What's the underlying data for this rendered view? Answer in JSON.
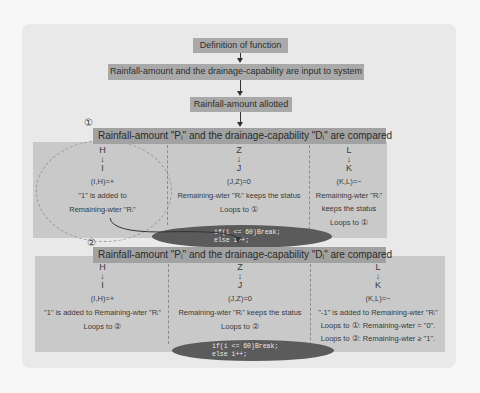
{
  "flow": {
    "step1": "Definition of function",
    "step2": "Rainfall-amount and the drainage-capability are input to system",
    "step3": "Rainfall-amount allotted"
  },
  "section1": {
    "number": "①",
    "header": "Rainfall-amount \"Pᵢ\" and the drainage-capability \"Dᵢ\" are compared",
    "columns": [
      {
        "top": "H",
        "arrow": "↓",
        "mid": "I",
        "pair": "(I,H)=+",
        "lines": [
          "\"1\" is added to",
          "Remaining-wter \"Rᵢ\""
        ]
      },
      {
        "top": "Z",
        "arrow": "↓",
        "mid": "J",
        "pair": "(J,Z)=0",
        "lines": [
          "Remaining-wter \"Rᵢ\" keeps the status",
          "Loops to ①"
        ]
      },
      {
        "top": "L",
        "arrow": "↓",
        "mid": "K",
        "pair": "(K,L)=−",
        "lines": [
          "Remaining-wter \"Rᵢ\"",
          "keeps the status",
          "Loops to ①"
        ]
      }
    ],
    "condition": [
      "if(i <= 60)Break;",
      "else i++;"
    ]
  },
  "section2": {
    "number": "②",
    "header": "Rainfall-amount \"Pᵢ\" and the drainage-capability \"Dᵢ\" are compared",
    "columns": [
      {
        "top": "H",
        "arrow": "↓",
        "mid": "I",
        "pair": "(I,H)=+",
        "lines": [
          "\"1\" is added to Remaining-wter \"Rᵢ\"",
          "Loops to ②"
        ]
      },
      {
        "top": "Z",
        "arrow": "↓",
        "mid": "J",
        "pair": "(J,Z)=0",
        "lines": [
          "Remaining-wter \"Rᵢ\" keeps the status",
          "Loops to ②"
        ]
      },
      {
        "top": "L",
        "arrow": "↓",
        "mid": "K",
        "pair": "(K,L)=−",
        "lines": [
          "\"-1\" is added to Remaining-wter \"Rᵢ\"",
          "Loops to ①: Remaining-wter = \"0\".",
          "Loops to ②: Remaining-wter ≥ \"1\"."
        ]
      }
    ],
    "condition": [
      "if(i <= 60)Break;",
      "else i++;"
    ]
  },
  "colors": {
    "background": "#f7f7f7",
    "outer_panel": "#e9e9e9",
    "box": "#a9a9a9",
    "panel": "#c9c9c9",
    "ellipse": "#5b5b5b"
  }
}
